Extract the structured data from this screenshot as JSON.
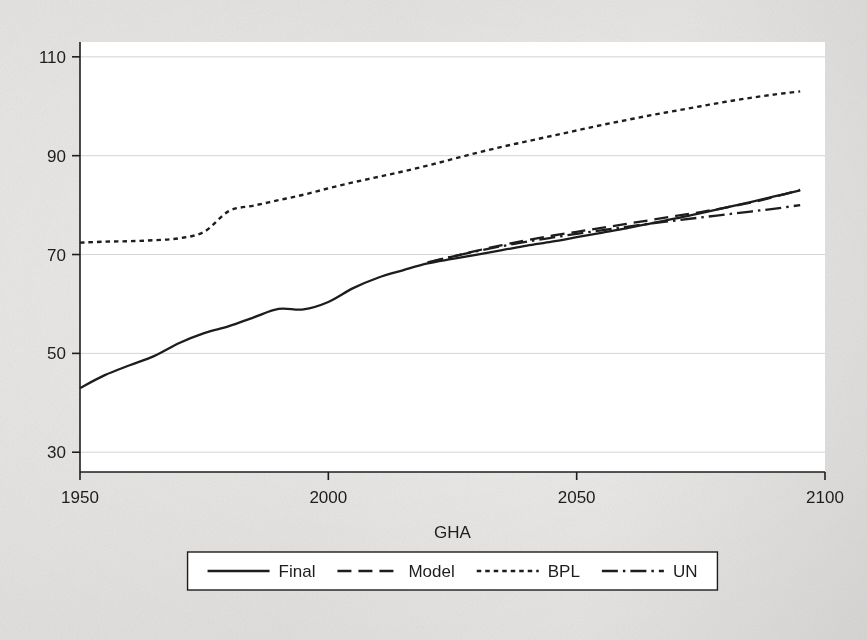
{
  "figure": {
    "background_color": "#dedcda",
    "plot_background_color": "#ffffff",
    "ink_color": "#1d1d1d",
    "gridline_color": "#cfcfcf"
  },
  "chart_data": {
    "type": "line",
    "title": "",
    "xlabel": "GHA",
    "ylabel": "",
    "xlim": [
      1950,
      2100
    ],
    "ylim": [
      26,
      113
    ],
    "xticks": [
      1950,
      2000,
      2050,
      2100
    ],
    "xtick_labels": [
      "1950",
      "2000",
      "2050",
      "2100"
    ],
    "yticks": [
      30,
      50,
      70,
      90,
      110
    ],
    "ytick_labels": [
      "30",
      "50",
      "70",
      "90",
      "110"
    ],
    "grid": "horizontal",
    "legend_position": "below-axes",
    "series": [
      {
        "name": "Final",
        "style": "solid",
        "x": [
          1950,
          1955,
          1960,
          1965,
          1970,
          1975,
          1980,
          1985,
          1990,
          1995,
          2000,
          2005,
          2010,
          2015,
          2020,
          2025,
          2030,
          2035,
          2040,
          2045,
          2050,
          2055,
          2060,
          2065,
          2070,
          2075,
          2080,
          2085,
          2090,
          2095
        ],
        "y": [
          43.0,
          45.6,
          47.6,
          49.5,
          52.1,
          54.1,
          55.5,
          57.3,
          59.0,
          58.9,
          60.4,
          63.2,
          65.3,
          66.8,
          68.2,
          69.1,
          70.0,
          70.9,
          71.8,
          72.6,
          73.5,
          74.4,
          75.3,
          76.3,
          77.3,
          78.4,
          79.5,
          80.6,
          81.8,
          83.0
        ]
      },
      {
        "name": "Model",
        "style": "dashed",
        "x": [
          2020,
          2025,
          2030,
          2035,
          2040,
          2045,
          2050,
          2055,
          2060,
          2065,
          2070,
          2075,
          2080,
          2085,
          2090,
          2095
        ],
        "y": [
          68.3,
          69.6,
          70.8,
          71.9,
          72.9,
          73.8,
          74.6,
          75.4,
          76.2,
          77.0,
          77.8,
          78.6,
          79.5,
          80.5,
          81.7,
          83.1
        ]
      },
      {
        "name": "BPL",
        "style": "dotted",
        "x": [
          1950,
          1955,
          1960,
          1965,
          1970,
          1975,
          1980,
          1985,
          1990,
          1995,
          2000,
          2005,
          2010,
          2015,
          2020,
          2025,
          2030,
          2035,
          2040,
          2045,
          2050,
          2055,
          2060,
          2065,
          2070,
          2075,
          2080,
          2085,
          2090,
          2095
        ],
        "y": [
          72.4,
          72.6,
          72.7,
          72.9,
          73.3,
          74.6,
          78.8,
          79.9,
          81.0,
          82.1,
          83.4,
          84.6,
          85.7,
          86.8,
          88.0,
          89.3,
          90.6,
          91.8,
          92.9,
          94.0,
          95.1,
          96.2,
          97.2,
          98.2,
          99.1,
          100.0,
          100.9,
          101.7,
          102.4,
          103.0
        ]
      },
      {
        "name": "UN",
        "style": "dashdot",
        "x": [
          2020,
          2025,
          2030,
          2035,
          2040,
          2045,
          2050,
          2055,
          2060,
          2065,
          2070,
          2075,
          2080,
          2085,
          2090,
          2095
        ],
        "y": [
          68.4,
          69.6,
          70.7,
          71.7,
          72.6,
          73.4,
          74.2,
          74.9,
          75.6,
          76.3,
          76.9,
          77.5,
          78.1,
          78.7,
          79.3,
          80.0
        ]
      }
    ]
  },
  "legend": {
    "items": [
      {
        "label": "Final",
        "style": "solid"
      },
      {
        "label": "Model",
        "style": "dashed"
      },
      {
        "label": "BPL",
        "style": "dotted"
      },
      {
        "label": "UN",
        "style": "dashdot"
      }
    ]
  }
}
